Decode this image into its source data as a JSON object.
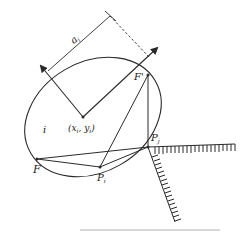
{
  "diagram": {
    "type": "geometry-reflection",
    "colors": {
      "stroke": "#2a2a2a",
      "background": "#ffffff",
      "caption": "#d8d8d8"
    },
    "labels": {
      "axis_length": "a",
      "axis_length_sub": "i",
      "center": "(x",
      "center_sub1": "i",
      "center_mid": ", y",
      "center_sub2": "i",
      "center_close": ")",
      "region": "i",
      "focus_left": "F",
      "focus_right": "F'",
      "point_i": "P",
      "point_i_sub": "i",
      "point_j": "P",
      "point_j_sub": "j"
    },
    "points": {
      "center": [
        83,
        117
      ],
      "F": [
        37,
        159
      ],
      "F_prime": [
        148,
        75
      ],
      "P_i": [
        100,
        167
      ],
      "P_j": [
        148,
        147
      ]
    }
  }
}
